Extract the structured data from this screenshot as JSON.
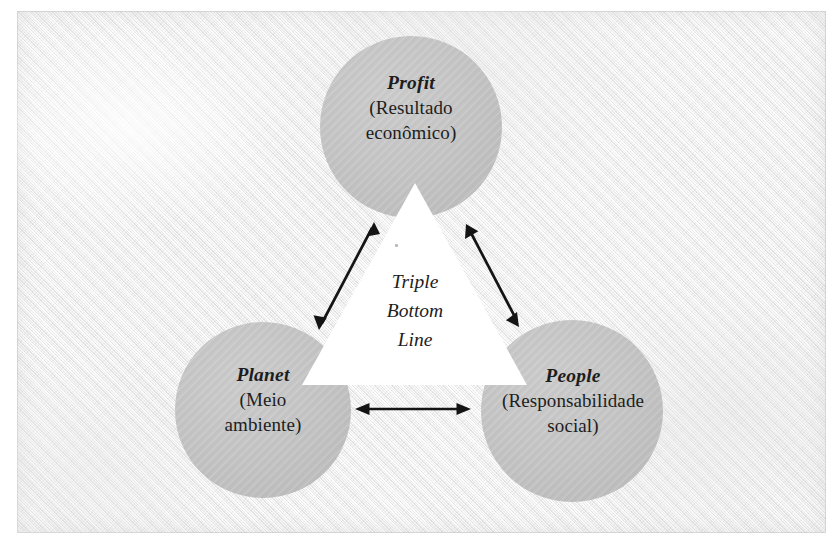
{
  "diagram": {
    "title": "Triple Bottom Line",
    "center_lines": [
      "Triple",
      "Bottom",
      "Line"
    ],
    "colors": {
      "circle_fill": "#c3c3c3",
      "triangle_fill": "#ffffff",
      "arrow": "#141414",
      "text": "#1d1d1d",
      "paper": "#f1f1f1",
      "frame_border": "#c3c3c3"
    },
    "nodes": [
      {
        "id": "profit",
        "title": "Profit",
        "subtitle_lines": [
          "(Resultado",
          "econômico)"
        ],
        "position": "top",
        "cx": 411,
        "cy": 127,
        "r": 91
      },
      {
        "id": "planet",
        "title": "Planet",
        "subtitle_lines": [
          "(Meio",
          "ambiente)"
        ],
        "position": "bottom-left",
        "cx": 263,
        "cy": 410,
        "r": 88
      },
      {
        "id": "people",
        "title": "People",
        "subtitle_lines": [
          "(Responsabilidade",
          "social)"
        ],
        "position": "bottom-right",
        "cx": 572,
        "cy": 411,
        "r": 91
      }
    ],
    "triangle": {
      "apex": [
        415,
        183
      ],
      "bottom_left": [
        302,
        385
      ],
      "bottom_right": [
        527,
        385
      ]
    },
    "arrows": [
      {
        "id": "profit-planet",
        "from": "planet",
        "to": "profit",
        "double_headed": true,
        "x1": 320,
        "y1": 327,
        "x2": 374,
        "y2": 224
      },
      {
        "id": "profit-people",
        "from": "profit",
        "to": "people",
        "double_headed": true,
        "x1": 467,
        "y1": 225,
        "x2": 518,
        "y2": 324
      },
      {
        "id": "planet-people",
        "from": "planet",
        "to": "people",
        "double_headed": true,
        "x1": 356,
        "y1": 409,
        "x2": 470,
        "y2": 409
      }
    ]
  }
}
